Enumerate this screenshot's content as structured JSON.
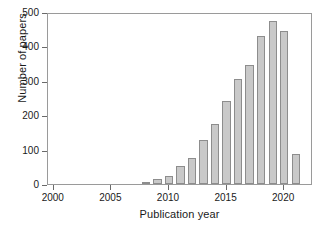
{
  "chart_data": {
    "type": "bar",
    "title": "",
    "xlabel": "Publication year",
    "ylabel": "Number of papers",
    "categories": [
      2000,
      2001,
      2002,
      2003,
      2004,
      2005,
      2006,
      2007,
      2008,
      2009,
      2010,
      2011,
      2012,
      2013,
      2014,
      2015,
      2016,
      2017,
      2018,
      2019,
      2020,
      2021
    ],
    "values": [
      0,
      0,
      0,
      0,
      0,
      0,
      0,
      0,
      1,
      14,
      22,
      52,
      76,
      127,
      175,
      241,
      305,
      346,
      431,
      474,
      446,
      88
    ],
    "xlim": [
      1999.5,
      2022.5
    ],
    "ylim": [
      0,
      500
    ],
    "yticks": [
      0,
      100,
      200,
      300,
      400,
      500
    ],
    "ytick_labels": [
      "0",
      "100",
      "200",
      "300",
      "400",
      "500"
    ],
    "xticks": [
      2000,
      2005,
      2010,
      2015,
      2020
    ],
    "xtick_labels": [
      "2000",
      "2005",
      "2010",
      "2015",
      "2020"
    ],
    "grid": false,
    "legend": null,
    "bar_color": "#c9c9c9",
    "bar_edge_color": "#8d8d8d",
    "axis_color": "#9a9a9a",
    "text_color": "#1a1a1a"
  }
}
